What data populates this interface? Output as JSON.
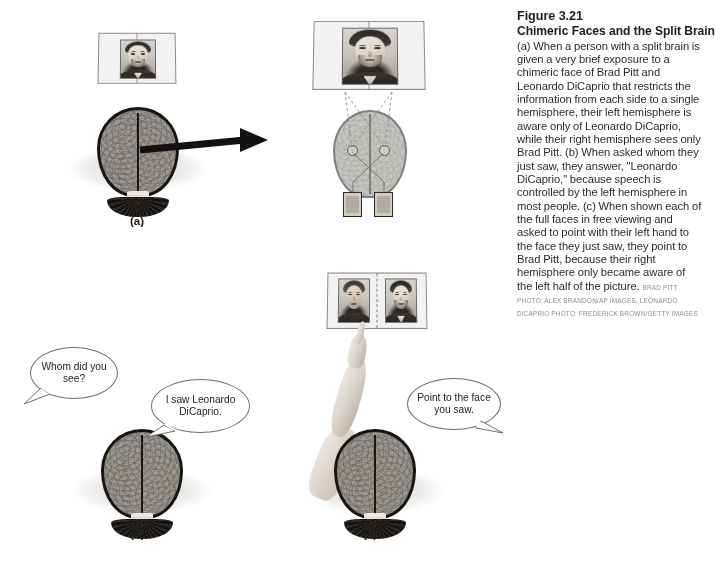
{
  "figure": {
    "number": "Figure 3.21",
    "title": "Chimeric Faces and the Split Brain",
    "caption": "(a) When a person with a split brain is given a very brief exposure to a chimeric face of Brad Pitt and Leonardo DiCaprio that restricts the information from each side to a single hemisphere, their left hemisphere is aware only of Leonardo DiCaprio, while their right hemisphere sees only Brad Pitt. (b) When asked whom they just saw, they answer, \"Leonardo DiCaprio,\" because speech is controlled by the left hemisphere in most people. (c) When shown each of the full faces in free viewing and asked to point with their left hand to the face they just saw, they point to Brad Pitt, because their right hemisphere only became aware of the left half of the picture.",
    "credit": "BRAD PITT PHOTO: ALEX BRANDON/AP IMAGES, LEONARDO DiCAPRIO PHOTO: FREDERICK BROWN/GETTY IMAGES"
  },
  "panels": {
    "a": {
      "label": "(a)",
      "screen_left": {
        "name": "chimeric-face-screen",
        "image_alt": "chimeric face of Brad Pitt and Leonardo DiCaprio"
      },
      "screen_right": {
        "name": "chimeric-face-screen-enlarged",
        "image_alt": "chimeric face of Brad Pitt and Leonardo DiCaprio"
      },
      "head_left_alt": "top view of head with brain, split-brain patient",
      "head_right_alt": "top view of brain showing crossed optic pathways",
      "inset_left_alt": "Brad Pitt half-face seen by right hemisphere",
      "inset_right_alt": "Leonardo DiCaprio half-face seen by left hemisphere"
    },
    "b": {
      "label": "(b)",
      "question": "Whom did you see?",
      "answer": "I saw Leonardo DiCaprio.",
      "head_alt": "top view of head with brain, split-brain patient answering"
    },
    "c": {
      "label": "(c)",
      "instruction": "Point to the face you saw.",
      "screen": {
        "name": "full-faces-screen",
        "left_face_alt": "Brad Pitt full face",
        "right_face_alt": "Leonardo DiCaprio full face"
      },
      "head_alt": "top view of head with brain, left hand raised pointing"
    }
  },
  "colors": {
    "page_background": "#ffffff",
    "text": "#1d1d1b",
    "caption_text": "#2b2b2b",
    "credit_text": "#8d8d8d",
    "bubble_stroke": "#6f6f6f",
    "brain_outline": "#17150f",
    "arrow": "#111111",
    "screen_fill": "#f2f2f2",
    "screen_stroke": "#8a8a8a"
  }
}
